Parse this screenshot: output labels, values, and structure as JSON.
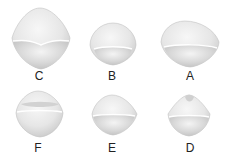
{
  "figure": {
    "background": "#ffffff",
    "shape_fill_light": "#f2f2f2",
    "shape_fill_mid": "#dcdcdc",
    "shape_fill_dark": "#c4c4c4",
    "shape_edge": "#bdbdbd",
    "label_color": "#222222",
    "specimens": [
      {
        "id": "C",
        "label": "C",
        "row": 1,
        "col": 1
      },
      {
        "id": "B",
        "label": "B",
        "row": 1,
        "col": 2
      },
      {
        "id": "A",
        "label": "A",
        "row": 1,
        "col": 3
      },
      {
        "id": "F",
        "label": "F",
        "row": 2,
        "col": 1
      },
      {
        "id": "E",
        "label": "E",
        "row": 2,
        "col": 2
      },
      {
        "id": "D",
        "label": "D",
        "row": 2,
        "col": 3
      }
    ]
  }
}
